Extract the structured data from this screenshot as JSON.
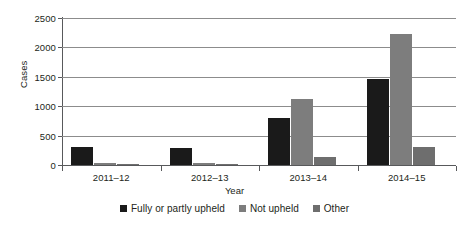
{
  "chart_data": {
    "type": "bar",
    "title": "",
    "xlabel": "Year",
    "ylabel": "Cases",
    "categories": [
      "2011–12",
      "2012–13",
      "2013–14",
      "2014–15"
    ],
    "series": [
      {
        "name": "Fully or partly upheld",
        "color": "#1a1a1a",
        "values": [
          300,
          285,
          800,
          1470
        ]
      },
      {
        "name": "Not upheld",
        "color": "#7d7d7d",
        "values": [
          40,
          35,
          1120,
          2230
        ]
      },
      {
        "name": "Other",
        "color": "#6e6e6e",
        "values": [
          25,
          20,
          130,
          300
        ]
      }
    ],
    "ylim": [
      0,
      2500
    ],
    "ytick_values": [
      0,
      500,
      1000,
      1500,
      2000,
      2500
    ],
    "ytick_labels": [
      "0",
      "500",
      "1000",
      "1500",
      "2000",
      "2500"
    ],
    "grid": true,
    "legend_position": "bottom"
  },
  "axes": {
    "y_title": "Cases",
    "x_title": "Year"
  },
  "colors": {
    "gridline": "#8c8c8c",
    "axis": "#58595b",
    "text": "#231f20",
    "background": "#ffffff"
  }
}
